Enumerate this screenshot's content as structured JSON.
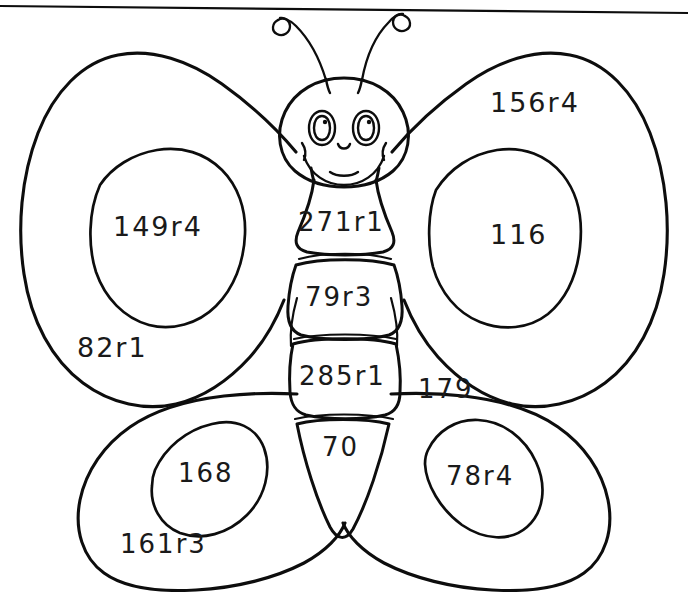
{
  "page": {
    "kind": "coloring-worksheet",
    "ink_color": "#0d0d0d",
    "background_color": "#ffffff",
    "width": 688,
    "height": 592
  },
  "scan_edge": {
    "name": "top-border-line",
    "description": "slightly tilted horizontal scan border across the top"
  },
  "head": {
    "name": "butterfly-head",
    "features": [
      "left-eye",
      "right-eye",
      "nose",
      "smile",
      "lower-lip",
      "left-antenna",
      "right-antenna"
    ]
  },
  "answers": {
    "body_segments": [
      {
        "id": "segment-1",
        "value": "271r1"
      },
      {
        "id": "segment-2",
        "value": "79r3"
      },
      {
        "id": "segment-3",
        "value": "285r1"
      },
      {
        "id": "segment-4",
        "value": "70"
      }
    ],
    "wings": [
      {
        "id": "upper-left",
        "outer": "82r1",
        "inner": "149r4"
      },
      {
        "id": "upper-right",
        "outer": "156r4",
        "inner": "116"
      },
      {
        "id": "lower-left",
        "outer": "161r3",
        "inner": "168"
      },
      {
        "id": "lower-right",
        "outer": "179",
        "inner": "78r4"
      }
    ]
  },
  "labels": {
    "upper_left_inner": "149r4",
    "upper_left_outer": "82r1",
    "upper_right_outer": "156r4",
    "upper_right_inner": "116",
    "lower_left_inner": "168",
    "lower_left_outer": "161r3",
    "lower_right_outer": "179",
    "lower_right_inner": "78r4",
    "body_1": "271r1",
    "body_2": "79r3",
    "body_3": "285r1",
    "body_4": "70"
  }
}
